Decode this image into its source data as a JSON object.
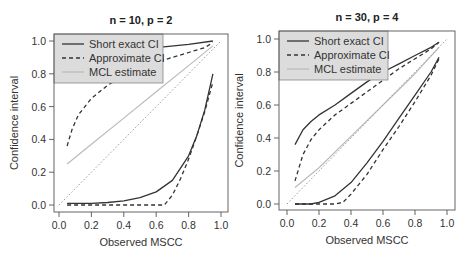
{
  "chart_data": [
    {
      "type": "line",
      "title": "n = 10, p = 2",
      "xlabel": "Observed MSCC",
      "ylabel": "Confidence interval",
      "xlim": [
        0,
        1
      ],
      "ylim": [
        0,
        1
      ],
      "xticks": [
        "0.0",
        "0.2",
        "0.4",
        "0.6",
        "0.8",
        "1.0"
      ],
      "yticks": [
        "0.0",
        "0.2",
        "0.4",
        "0.6",
        "0.8",
        "1.0"
      ],
      "grid": false,
      "legend_position": "top-left",
      "legend": [
        "Short exact CI",
        "Approximate CI",
        "MCL estimate"
      ],
      "series": [
        {
          "name": "Short exact CI (upper)",
          "style": "solid",
          "color": "#333333",
          "x": [
            0.05,
            0.2,
            0.4,
            0.6,
            0.8,
            0.95
          ],
          "y": [
            0.88,
            0.91,
            0.94,
            0.96,
            0.98,
            1.0
          ]
        },
        {
          "name": "Short exact CI (lower)",
          "style": "solid",
          "color": "#333333",
          "x": [
            0.05,
            0.2,
            0.3,
            0.4,
            0.5,
            0.6,
            0.7,
            0.8,
            0.85,
            0.9,
            0.95
          ],
          "y": [
            0.01,
            0.01,
            0.015,
            0.025,
            0.045,
            0.08,
            0.15,
            0.3,
            0.42,
            0.58,
            0.8
          ]
        },
        {
          "name": "Approximate CI (upper)",
          "style": "dashed",
          "color": "#333333",
          "x": [
            0.05,
            0.08,
            0.12,
            0.2,
            0.3,
            0.4,
            0.5,
            0.6,
            0.7,
            0.8,
            0.9,
            0.95
          ],
          "y": [
            0.36,
            0.46,
            0.55,
            0.65,
            0.73,
            0.79,
            0.83,
            0.87,
            0.9,
            0.93,
            0.96,
            0.99
          ]
        },
        {
          "name": "Approximate CI (lower)",
          "style": "dashed",
          "color": "#333333",
          "x": [
            0.05,
            0.3,
            0.5,
            0.65,
            0.7,
            0.75,
            0.8,
            0.85,
            0.9,
            0.95
          ],
          "y": [
            0.0,
            0.0,
            0.0,
            0.0,
            0.06,
            0.16,
            0.28,
            0.42,
            0.57,
            0.75
          ]
        },
        {
          "name": "MCL estimate",
          "style": "solid",
          "color": "#bbbbbb",
          "x": [
            0.05,
            0.2,
            0.4,
            0.6,
            0.8,
            0.95
          ],
          "y": [
            0.25,
            0.37,
            0.53,
            0.69,
            0.85,
            0.97
          ]
        },
        {
          "name": "Identity line",
          "style": "dotted",
          "color": "#999999",
          "x": [
            0.0,
            1.0
          ],
          "y": [
            0.0,
            1.0
          ]
        }
      ]
    },
    {
      "type": "line",
      "title": "n = 30, p = 4",
      "xlabel": "Observed MSCC",
      "ylabel": "Confidence interval",
      "xlim": [
        0,
        1
      ],
      "ylim": [
        0,
        1
      ],
      "xticks": [
        "0.0",
        "0.2",
        "0.4",
        "0.6",
        "0.8",
        "1.0"
      ],
      "yticks": [
        "0.0",
        "0.2",
        "0.4",
        "0.6",
        "0.8",
        "1.0"
      ],
      "grid": false,
      "legend_position": "top-left",
      "legend": [
        "Short exact CI",
        "Approximate CI",
        "MCL estimate"
      ],
      "series": [
        {
          "name": "Short exact CI (upper)",
          "style": "solid",
          "color": "#333333",
          "x": [
            0.05,
            0.1,
            0.15,
            0.2,
            0.3,
            0.4,
            0.5,
            0.6,
            0.7,
            0.8,
            0.9,
            0.95
          ],
          "y": [
            0.36,
            0.45,
            0.5,
            0.54,
            0.6,
            0.67,
            0.74,
            0.8,
            0.85,
            0.9,
            0.95,
            0.98
          ]
        },
        {
          "name": "Short exact CI (lower)",
          "style": "solid",
          "color": "#333333",
          "x": [
            0.05,
            0.15,
            0.2,
            0.3,
            0.4,
            0.5,
            0.6,
            0.7,
            0.8,
            0.9,
            0.95
          ],
          "y": [
            0.0,
            0.0,
            0.01,
            0.05,
            0.13,
            0.25,
            0.38,
            0.52,
            0.66,
            0.8,
            0.89
          ]
        },
        {
          "name": "Approximate CI (upper)",
          "style": "dashed",
          "color": "#333333",
          "x": [
            0.05,
            0.1,
            0.15,
            0.2,
            0.3,
            0.4,
            0.5,
            0.6,
            0.7,
            0.8,
            0.9,
            0.95
          ],
          "y": [
            0.14,
            0.3,
            0.39,
            0.45,
            0.54,
            0.61,
            0.68,
            0.75,
            0.82,
            0.88,
            0.94,
            0.98
          ]
        },
        {
          "name": "Approximate CI (lower)",
          "style": "dashed",
          "color": "#333333",
          "x": [
            0.05,
            0.2,
            0.3,
            0.35,
            0.4,
            0.5,
            0.6,
            0.7,
            0.8,
            0.9,
            0.95
          ],
          "y": [
            0.0,
            0.0,
            0.0,
            0.01,
            0.06,
            0.18,
            0.33,
            0.47,
            0.62,
            0.78,
            0.88
          ]
        },
        {
          "name": "MCL estimate",
          "style": "solid",
          "color": "#bbbbbb",
          "x": [
            0.05,
            0.2,
            0.4,
            0.6,
            0.8,
            0.95
          ],
          "y": [
            0.1,
            0.22,
            0.41,
            0.6,
            0.79,
            0.95
          ]
        },
        {
          "name": "Identity line",
          "style": "dotted",
          "color": "#999999",
          "x": [
            0.0,
            1.0
          ],
          "y": [
            0.0,
            1.0
          ]
        }
      ]
    }
  ],
  "layout": [
    {
      "box": [
        54,
        34,
        228,
        212
      ],
      "x0": 59,
      "x1": 221,
      "y0": 205,
      "y1": 41,
      "legend_box": [
        54,
        34,
        163,
        83
      ]
    },
    {
      "box": [
        279,
        31,
        455,
        210
      ],
      "x0": 287,
      "x1": 447,
      "y0": 204,
      "y1": 39,
      "legend_box": [
        279,
        31,
        388,
        80
      ]
    }
  ]
}
